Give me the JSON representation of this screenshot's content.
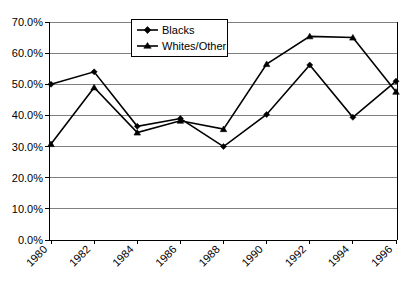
{
  "chart_data": {
    "type": "line",
    "title": "",
    "xlabel": "",
    "ylabel": "",
    "categories": [
      "1980",
      "1982",
      "1984",
      "1986",
      "1988",
      "1990",
      "1992",
      "1994",
      "1996"
    ],
    "ylim": [
      0,
      70
    ],
    "ytick_labels": [
      "70.0%",
      "60.0%",
      "50.0%",
      "40.0%",
      "30.0%",
      "20.0%",
      "10.0%",
      "0.0%"
    ],
    "ytick_values": [
      70,
      60,
      50,
      40,
      30,
      20,
      10,
      0
    ],
    "grid": "horizontal",
    "legend_position": "upper-left-inside",
    "series": [
      {
        "name": "Blacks",
        "marker": "diamond",
        "values": [
          50.0,
          54.0,
          36.5,
          39.0,
          30.0,
          40.3,
          56.2,
          39.4,
          51.0
        ]
      },
      {
        "name": "Whites/Other",
        "marker": "triangle",
        "values": [
          30.8,
          49.0,
          34.5,
          38.3,
          35.6,
          56.5,
          65.4,
          65.0,
          47.6
        ]
      }
    ]
  },
  "axis": {
    "y_labels": [
      "70.0%",
      "60.0%",
      "50.0%",
      "40.0%",
      "30.0%",
      "20.0%",
      "10.0%",
      "0.0%"
    ],
    "x_labels": [
      "1980",
      "1982",
      "1984",
      "1986",
      "1988",
      "1990",
      "1992",
      "1994",
      "1996"
    ]
  },
  "legend": {
    "entries": [
      {
        "label": "Blacks"
      },
      {
        "label": "Whites/Other"
      }
    ]
  }
}
